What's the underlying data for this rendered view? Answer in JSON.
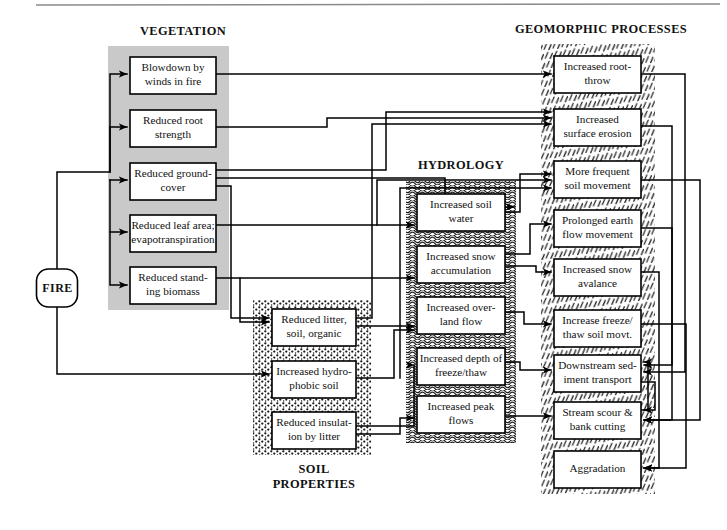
{
  "diagram": {
    "title_visible": false,
    "source_node": {
      "label": "FIRE",
      "x": 57,
      "y": 288
    },
    "groups": [
      {
        "id": "vegetation",
        "label": "VEGETATION",
        "label_x": 183,
        "label_y": 32,
        "fill": "#c9c9c9",
        "pattern": "solid-gray",
        "band": {
          "x": 108,
          "y": 46,
          "w": 121,
          "h": 264
        }
      },
      {
        "id": "soil",
        "label": "SOIL\nPROPERTIES",
        "label_x": 314,
        "label_y": 470,
        "fill": "#ffffff",
        "pattern": "dots",
        "band": {
          "x": 253,
          "y": 300,
          "w": 118,
          "h": 155
        }
      },
      {
        "id": "hydrology",
        "label": "HYDROLOGY",
        "label_x": 461,
        "label_y": 166,
        "fill": "#ffffff",
        "pattern": "waves",
        "band": {
          "x": 406,
          "y": 181,
          "w": 110,
          "h": 262
        }
      },
      {
        "id": "geomorphic",
        "label": "GEOMORPHIC PROCESSES",
        "label_x": 601,
        "label_y": 30,
        "fill": "#ffffff",
        "pattern": "hatch",
        "band": {
          "x": 541,
          "y": 44,
          "w": 114,
          "h": 450
        }
      }
    ],
    "soil_label_line1": "SOIL",
    "soil_label_line2": "PROPERTIES",
    "nodes": [
      {
        "id": "v1",
        "group": "vegetation",
        "x": 130,
        "y": 57,
        "w": 86,
        "h": 37,
        "lines": [
          "Blowdown by",
          "winds in fire"
        ]
      },
      {
        "id": "v2",
        "group": "vegetation",
        "x": 130,
        "y": 110,
        "w": 86,
        "h": 37,
        "lines": [
          "Reduced root",
          "strength"
        ]
      },
      {
        "id": "v3",
        "group": "vegetation",
        "x": 130,
        "y": 163,
        "w": 86,
        "h": 37,
        "lines": [
          "Reduced ground-",
          "cover"
        ]
      },
      {
        "id": "v4",
        "group": "vegetation",
        "x": 130,
        "y": 215,
        "w": 86,
        "h": 37,
        "lines": [
          "Reduced leaf area;",
          "evapotranspiration"
        ]
      },
      {
        "id": "v5",
        "group": "vegetation",
        "x": 130,
        "y": 267,
        "w": 86,
        "h": 37,
        "lines": [
          "Reduced stand-",
          "ing biomass"
        ]
      },
      {
        "id": "s1",
        "group": "soil",
        "x": 272,
        "y": 309,
        "w": 84,
        "h": 37,
        "lines": [
          "Reduced litter,",
          "soil, organic"
        ]
      },
      {
        "id": "s2",
        "group": "soil",
        "x": 272,
        "y": 361,
        "w": 84,
        "h": 37,
        "lines": [
          "Increased hydro-",
          "phobic soil"
        ]
      },
      {
        "id": "s3",
        "group": "soil",
        "x": 272,
        "y": 412,
        "w": 84,
        "h": 37,
        "lines": [
          "Reduced insulat-",
          "ion by litter"
        ]
      },
      {
        "id": "h1",
        "group": "hydrology",
        "x": 417,
        "y": 194,
        "w": 88,
        "h": 37,
        "lines": [
          "Increased soil",
          "water"
        ]
      },
      {
        "id": "h2",
        "group": "hydrology",
        "x": 417,
        "y": 246,
        "w": 88,
        "h": 37,
        "lines": [
          "Increased snow",
          "accumulation"
        ]
      },
      {
        "id": "h3",
        "group": "hydrology",
        "x": 417,
        "y": 297,
        "w": 88,
        "h": 37,
        "lines": [
          "Increased over-",
          "land flow"
        ]
      },
      {
        "id": "h4",
        "group": "hydrology",
        "x": 417,
        "y": 348,
        "w": 88,
        "h": 37,
        "lines": [
          "Increased depth of",
          "freeze/thaw"
        ]
      },
      {
        "id": "h5",
        "group": "hydrology",
        "x": 417,
        "y": 396,
        "w": 88,
        "h": 37,
        "lines": [
          "Increased peak",
          "flows"
        ]
      },
      {
        "id": "g1",
        "group": "geomorphic",
        "x": 554,
        "y": 56,
        "w": 87,
        "h": 37,
        "lines": [
          "Increased root-",
          "throw"
        ]
      },
      {
        "id": "g2",
        "group": "geomorphic",
        "x": 554,
        "y": 109,
        "w": 87,
        "h": 37,
        "lines": [
          "Increased",
          "surface erosion"
        ]
      },
      {
        "id": "g3",
        "group": "geomorphic",
        "x": 554,
        "y": 161,
        "w": 87,
        "h": 37,
        "lines": [
          "More frequent",
          "soil movement"
        ]
      },
      {
        "id": "g4",
        "group": "geomorphic",
        "x": 554,
        "y": 210,
        "w": 87,
        "h": 37,
        "lines": [
          "Prolonged earth",
          "flow movement"
        ]
      },
      {
        "id": "g5",
        "group": "geomorphic",
        "x": 554,
        "y": 259,
        "w": 87,
        "h": 37,
        "lines": [
          "Increased snow",
          "avalance"
        ]
      },
      {
        "id": "g6",
        "group": "geomorphic",
        "x": 554,
        "y": 310,
        "w": 87,
        "h": 37,
        "lines": [
          "Increase freeze/",
          "thaw soil movt."
        ]
      },
      {
        "id": "g7",
        "group": "geomorphic",
        "x": 554,
        "y": 355,
        "w": 87,
        "h": 37,
        "lines": [
          "Downstream sed-",
          "iment transport"
        ]
      },
      {
        "id": "g8",
        "group": "geomorphic",
        "x": 554,
        "y": 402,
        "w": 87,
        "h": 37,
        "lines": [
          "Stream scour &",
          "bank cutting"
        ]
      },
      {
        "id": "g9",
        "group": "geomorphic",
        "x": 554,
        "y": 451,
        "w": 87,
        "h": 37,
        "lines": [
          "Aggradation"
        ]
      }
    ],
    "edges": [
      {
        "from": "FIRE",
        "to": "v1",
        "path": "M57,270 L57,172 L110,172 L110,74 L127,74"
      },
      {
        "from": "FIRE",
        "to": "v2",
        "path": "M110,172 L110,127 L127,127"
      },
      {
        "from": "FIRE",
        "to": "v3",
        "path": "M110,180 L127,180"
      },
      {
        "from": "FIRE",
        "to": "v4",
        "path": "M110,180 L110,232 L127,232"
      },
      {
        "from": "FIRE",
        "to": "v5",
        "path": "M110,232 L110,285 L127,285"
      },
      {
        "from": "FIRE",
        "to": "s2",
        "path": "M57,306 L57,374 L269,374"
      },
      {
        "from": "v1",
        "to": "g1",
        "path": "M216,74 L551,74"
      },
      {
        "from": "v2",
        "to": "g2",
        "path": "M216,127 L327,127 L327,118 L551,118"
      },
      {
        "from": "v3",
        "to": "g2",
        "path": "M216,170 L386,170 L386,112 L551,112"
      },
      {
        "from": "v3",
        "to": "h1",
        "path": "M216,178 L445,178 L445,207 L514,207"
      },
      {
        "from": "v3",
        "to": "h3",
        "path": "M216,186 L231,186 L231,318 L269,318"
      },
      {
        "from": "v4",
        "to": "h1",
        "path": "M216,225 L414,225"
      },
      {
        "from": "v4",
        "to": "g3",
        "path": "M377,225 L377,180 L551,180"
      },
      {
        "from": "v5",
        "to": "h2",
        "path": "M216,278 L414,278"
      },
      {
        "from": "v5",
        "to": "s1",
        "path": "M240,278 L240,322 L269,322"
      },
      {
        "from": "s1",
        "to": "g2",
        "path": "M356,318 L372,318 L372,124 L551,124"
      },
      {
        "from": "s1",
        "to": "h3",
        "path": "M356,326 L414,326"
      },
      {
        "from": "s2",
        "to": "h3",
        "path": "M356,378 L394,378 L394,330 L414,330"
      },
      {
        "from": "s2",
        "to": "g3",
        "path": "M400,378 L400,188 L551,188"
      },
      {
        "from": "s3",
        "to": "h4",
        "path": "M356,426 L414,426 L414,365 L414,365"
      },
      {
        "from": "s3",
        "to": "h5",
        "path": "M356,434 L400,434 L400,418 L414,418"
      },
      {
        "from": "h1",
        "to": "g3",
        "path": "M505,212 L520,212 L520,174 L551,174"
      },
      {
        "from": "h2",
        "to": "g4",
        "path": "M505,254 L530,254 L530,224 L551,224"
      },
      {
        "from": "h2",
        "to": "g5",
        "path": "M505,266 L536,266 L536,272 L551,272"
      },
      {
        "from": "h3",
        "to": "g6",
        "path": "M505,312 L524,312 L524,324 L551,324"
      },
      {
        "from": "h4",
        "to": "g7",
        "path": "M505,362 L520,362 L520,370 L551,370"
      },
      {
        "from": "h5",
        "to": "g8",
        "path": "M505,416 L528,416 L528,416 L551,416"
      },
      {
        "from": "g1",
        "to": "g7",
        "path": "M641,74 L685,74 L685,372 L644,372"
      },
      {
        "from": "g2",
        "to": "g7",
        "path": "M641,126 L672,126 L672,365 L644,365"
      },
      {
        "from": "g3",
        "to": "g8",
        "path": "M641,180 L700,180 L700,420 L644,420"
      },
      {
        "from": "g4",
        "to": "g8",
        "path": "M641,228 L672,228 L672,420 L644,420"
      },
      {
        "from": "g5",
        "to": "g9",
        "path": "M641,272 L659,272 L659,468 L644,468"
      },
      {
        "from": "g6",
        "to": "g9",
        "path": "M641,324 L686,324 L686,468 L644,468"
      },
      {
        "from": "g7",
        "to": "g8",
        "path": "M641,382 L655,382 L655,410 L644,410"
      },
      {
        "from": "g8",
        "to": "g7",
        "path": "M641,410 L648,410 L648,362 L644,362"
      }
    ],
    "top_rule": {
      "x1": 36,
      "y1": 5,
      "x2": 720,
      "y2": 4
    }
  }
}
